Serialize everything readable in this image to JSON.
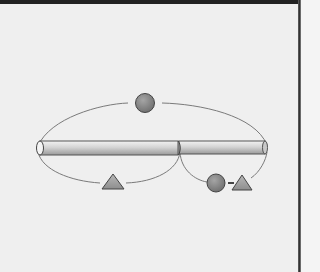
{
  "diagram": {
    "colors": {
      "background": "#efefef",
      "rod_fill": "#d9d9d9",
      "rod_stroke": "#555555",
      "shape_fill": "#8a8a8a",
      "triangle_fill": "#a8a8a8",
      "arc_stroke": "#777777"
    },
    "nodes": [
      {
        "id": "top-circle",
        "shape": "circle",
        "label": ""
      },
      {
        "id": "left-triangle",
        "shape": "triangle",
        "label": ""
      },
      {
        "id": "right-circle",
        "shape": "circle",
        "label": ""
      },
      {
        "id": "right-triangle",
        "shape": "triangle",
        "label": ""
      }
    ],
    "rod": {
      "segments": 2
    }
  }
}
